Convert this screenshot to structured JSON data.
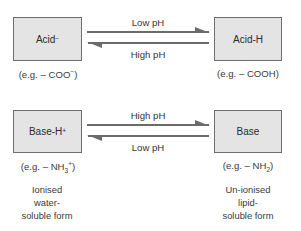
{
  "diagram": {
    "type": "ionisation-equilibrium",
    "colors": {
      "box_fill": "#e4e4e4",
      "box_border": "#6e6e6e",
      "arrow": "#6b6b6b",
      "text": "#2b2b2b"
    },
    "acid": {
      "left_box": {
        "label": "Acid",
        "superscript": "−"
      },
      "right_box": {
        "label": "Acid-H"
      },
      "left_example": {
        "prefix": "(e.g. – COO",
        "superscript": "−",
        "suffix": ")"
      },
      "right_example": {
        "text": "(e.g. – COOH)"
      },
      "forward_arrow_label": "Low pH",
      "reverse_arrow_label": "High pH"
    },
    "base": {
      "left_box": {
        "label": "Base-H",
        "superscript": "+"
      },
      "right_box": {
        "label": "Base"
      },
      "left_example": {
        "prefix": "(e.g. – NH",
        "subscript": "3",
        "superscript": "+",
        "suffix": ")"
      },
      "right_example": {
        "prefix": "(e.g. – NH",
        "subscript": "2",
        "suffix": ")"
      },
      "forward_arrow_label": "High pH",
      "reverse_arrow_label": "Low pH"
    },
    "left_description": {
      "lines": [
        "Ionised",
        "water-",
        "soluble form"
      ]
    },
    "right_description": {
      "lines": [
        "Un-ionised",
        "lipid-",
        "soluble form"
      ]
    }
  }
}
